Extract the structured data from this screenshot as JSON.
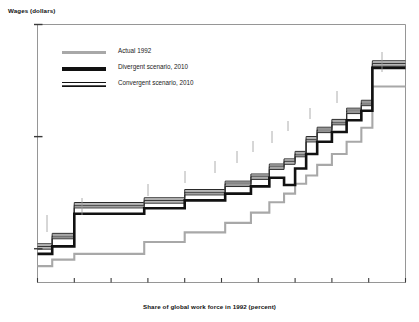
{
  "chart_data": {
    "type": "line",
    "subtype": "step",
    "title": "",
    "xlabel": "Share of global work force in 1992 (percent)",
    "ylabel": "Wages (dollars)",
    "xlim": [
      0,
      100
    ],
    "ylim": [
      500,
      100000
    ],
    "yscale": "log",
    "grid": false,
    "legend_position": "top-left",
    "xticks": [
      "0",
      "10",
      "20",
      "30",
      "40",
      "50",
      "60",
      "70",
      "80",
      "90",
      "100"
    ],
    "xtick_values": [
      0,
      10,
      20,
      30,
      40,
      50,
      60,
      70,
      80,
      90,
      100
    ],
    "yticks": [
      "1,000",
      "10,000",
      "100,000"
    ],
    "ytick_values": [
      1000,
      10000,
      100000
    ],
    "series": [
      {
        "name": "Actual 1992",
        "color": "#a8a8a8",
        "style": "solid-gray",
        "x": [
          0,
          4,
          4,
          10,
          10,
          29,
          29,
          40,
          40,
          51,
          51,
          58,
          58,
          63,
          63,
          67,
          67,
          70,
          70,
          73,
          73,
          76,
          76,
          80,
          80,
          84,
          84,
          88,
          88,
          91,
          91,
          100
        ],
        "y": [
          700,
          700,
          800,
          800,
          900,
          900,
          1150,
          1150,
          1400,
          1400,
          1700,
          1700,
          2100,
          2100,
          2600,
          2600,
          3100,
          3100,
          3800,
          3800,
          4500,
          4500,
          5600,
          5600,
          7000,
          7000,
          9000,
          9000,
          12000,
          12000,
          28000,
          28000
        ]
      },
      {
        "name": "Divergent scenario, 2010",
        "color": "#111111",
        "style": "thick-black",
        "x": [
          0,
          4,
          4,
          10,
          10,
          29,
          29,
          40,
          40,
          51,
          51,
          58,
          58,
          63,
          63,
          67,
          67,
          70,
          70,
          73,
          73,
          76,
          76,
          80,
          80,
          84,
          84,
          88,
          88,
          91,
          91,
          100
        ],
        "y": [
          900,
          900,
          1050,
          1050,
          2050,
          2050,
          2300,
          2300,
          2700,
          2700,
          3100,
          3100,
          3600,
          3600,
          4300,
          4300,
          3700,
          3700,
          5200,
          5200,
          7000,
          7000,
          9000,
          9000,
          11000,
          11000,
          14000,
          14000,
          17000,
          17000,
          41000,
          41000
        ]
      },
      {
        "name": "Convergent scenario, 2010",
        "color": "#333333",
        "style": "hatched",
        "x": [
          0,
          4,
          4,
          10,
          10,
          29,
          29,
          40,
          40,
          51,
          51,
          58,
          58,
          63,
          63,
          67,
          67,
          70,
          70,
          73,
          73,
          76,
          76,
          80,
          80,
          84,
          84,
          88,
          88,
          91,
          91,
          100
        ],
        "y": [
          1050,
          1050,
          1300,
          1300,
          2450,
          2450,
          2700,
          2700,
          3200,
          3200,
          3800,
          3800,
          4400,
          4400,
          5400,
          5400,
          6000,
          6000,
          7000,
          7000,
          9500,
          9500,
          11500,
          11500,
          13500,
          13500,
          17000,
          17000,
          20000,
          20000,
          45000,
          45000
        ]
      }
    ],
    "annotations": [
      {
        "text": "African farmers",
        "x": 5,
        "y": 4200
      },
      {
        "text": "Chinese farmers",
        "x": 14,
        "y": 5400
      },
      {
        "text": "South Asian farmers",
        "x": 32,
        "y": 7600
      },
      {
        "text": "Chinese unskilled",
        "x": 42,
        "y": 10500
      },
      {
        "text": "South Asian unskilled",
        "x": 50,
        "y": 13000
      },
      {
        "text": "Transitional unskilled",
        "x": 55,
        "y": 15500
      },
      {
        "text": "South Asian skilled",
        "x": 61,
        "y": 18500
      },
      {
        "text": "Latin American unskilled",
        "x": 63,
        "y": 22500
      },
      {
        "text": "Chinese skilled",
        "x": 69,
        "y": 27500
      },
      {
        "text": "Transitional skilled",
        "x": 73,
        "y": 34000
      },
      {
        "text": "OECD unskilled",
        "x": 79,
        "y": 43000
      },
      {
        "text": "OECD skilled",
        "x": 87,
        "y": 72000
      }
    ]
  },
  "legend": {
    "items": [
      {
        "label": "Actual 1992"
      },
      {
        "label": "Divergent scenario, 2010"
      },
      {
        "label": "Convergent scenario, 2010"
      }
    ]
  },
  "axes": {
    "y_title": "Wages (dollars)",
    "x_title": "Share of global work force in 1992 (percent)",
    "y_ticks": [
      "100,000",
      "10,000",
      "1,000"
    ],
    "x_ticks": [
      "0",
      "10",
      "20",
      "30",
      "40",
      "50",
      "60",
      "70",
      "80",
      "90",
      "100"
    ]
  }
}
